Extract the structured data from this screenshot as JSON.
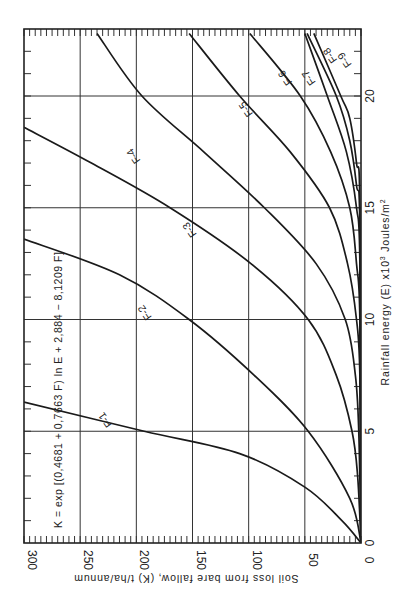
{
  "chart_data": {
    "type": "line",
    "title": "",
    "orientation": "rotated 90 degrees clockwise (y-axis along bottom, x-axis along right side)",
    "equation": "K = exp [(0,4681 + 0,7663 F) ln E + 2,884 − 8,1209 F]",
    "xlabel": "Rainfall energy (E) x10³ Joules/m²",
    "ylabel": "Soil loss from bare fallow, (K) t/ha/annum",
    "xlim": [
      0,
      22.8
    ],
    "ylim": [
      0,
      300
    ],
    "x_ticks": [
      "0",
      "5",
      "10",
      "15",
      "20"
    ],
    "y_ticks": [
      "0",
      "50",
      "100",
      "150",
      "200",
      "250",
      "300"
    ],
    "grid": true,
    "series": [
      {
        "name": "F-1",
        "points": [
          [
            0,
            0
          ],
          [
            1,
            17
          ],
          [
            2.5,
            50
          ],
          [
            4,
            108
          ],
          [
            5,
            193
          ],
          [
            6.3,
            300
          ]
        ]
      },
      {
        "name": "F-2",
        "points": [
          [
            0,
            0
          ],
          [
            2,
            10
          ],
          [
            5,
            47
          ],
          [
            7.5,
            95
          ],
          [
            10,
            153
          ],
          [
            12,
            215
          ],
          [
            13.6,
            300
          ]
        ]
      },
      {
        "name": "F-3",
        "points": [
          [
            0,
            0
          ],
          [
            3,
            3
          ],
          [
            5,
            8
          ],
          [
            7.5,
            22
          ],
          [
            10,
            47
          ],
          [
            12.5,
            98
          ],
          [
            15,
            170
          ],
          [
            17,
            240
          ],
          [
            18.6,
            300
          ]
        ]
      },
      {
        "name": "F-4",
        "points": [
          [
            0,
            0
          ],
          [
            5,
            2
          ],
          [
            7.5,
            5
          ],
          [
            10,
            14
          ],
          [
            12.5,
            40
          ],
          [
            15,
            86
          ],
          [
            17.5,
            140
          ],
          [
            20,
            195
          ],
          [
            22.8,
            235
          ]
        ]
      },
      {
        "name": "F-5",
        "points": [
          [
            0,
            0
          ],
          [
            7.5,
            1
          ],
          [
            10,
            4
          ],
          [
            12.5,
            12
          ],
          [
            15,
            28
          ],
          [
            17.5,
            63
          ],
          [
            20,
            108
          ],
          [
            22.8,
            153
          ]
        ]
      },
      {
        "name": "F-6",
        "points": [
          [
            0,
            0
          ],
          [
            10,
            1
          ],
          [
            12.5,
            4
          ],
          [
            15,
            10
          ],
          [
            17.5,
            27
          ],
          [
            20,
            54
          ],
          [
            22.8,
            99
          ]
        ]
      },
      {
        "name": "F-7",
        "points": [
          [
            0,
            0
          ],
          [
            12.5,
            1
          ],
          [
            15,
            4
          ],
          [
            17.5,
            13
          ],
          [
            20,
            30
          ],
          [
            22.8,
            50
          ]
        ]
      },
      {
        "name": "F-8",
        "points": [
          [
            0,
            0
          ],
          [
            14,
            1
          ],
          [
            16,
            4
          ],
          [
            18,
            10
          ],
          [
            20,
            22
          ],
          [
            22.8,
            48
          ]
        ]
      },
      {
        "name": "F-9",
        "points": [
          [
            0,
            0
          ],
          [
            15,
            1
          ],
          [
            17,
            4
          ],
          [
            19,
            10
          ],
          [
            20,
            18
          ],
          [
            22.8,
            42
          ]
        ]
      }
    ],
    "series_labels": [
      {
        "name": "F-1",
        "at": [
          5.6,
          225
        ]
      },
      {
        "name": "F-2",
        "at": [
          10.4,
          190
        ]
      },
      {
        "name": "F-3",
        "at": [
          14.1,
          150
        ]
      },
      {
        "name": "F-4",
        "at": [
          17.4,
          200
        ]
      },
      {
        "name": "F-5",
        "at": [
          19.5,
          100
        ]
      },
      {
        "name": "F-6",
        "at": [
          20.9,
          65
        ]
      },
      {
        "name": "F-7",
        "at": [
          20.9,
          44
        ]
      },
      {
        "name": "F-8",
        "at": [
          21.9,
          25
        ]
      },
      {
        "name": "F-9",
        "at": [
          21.7,
          12
        ]
      }
    ]
  },
  "axes": {
    "x_label_text": "Rainfall energy (E) x10",
    "x_label_sup": "3",
    "x_label_units": " Joules/m",
    "x_label_units_sup": "2",
    "y_label_text": "Soil loss from bare fallow, (K) t/ha/annum"
  },
  "colors": {
    "ink": "#1a1a1a",
    "background": "#ffffff"
  }
}
